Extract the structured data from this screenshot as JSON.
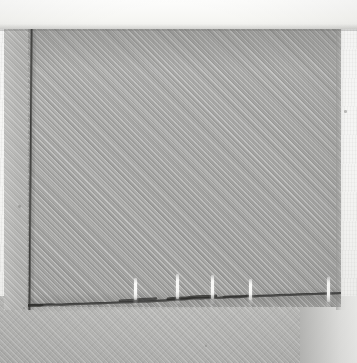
{
  "image": {
    "kind": "photograph",
    "subject": "grey woven twill fabric corner with seamed edge",
    "width": 357,
    "height": 363,
    "alt_text": "Close-up photograph of grey woven fabric showing a vertical stitched seam on the left and a dark raw cut bottom edge with five white thread markers"
  },
  "background": {
    "paper_color": "#f6f6f4",
    "top_band_color": "#fcfcfb",
    "top_band_height": 29
  },
  "regions": {
    "main_cloth": {
      "label": "main fabric panel",
      "color": "#a8a8a6",
      "x": 28,
      "y": 29,
      "width": 313,
      "height": 278,
      "weave": "twill-diagonal-45"
    },
    "selvage_strip": {
      "label": "left selvage strip",
      "color": "#b6b6b4",
      "x": 4,
      "y": 29,
      "width": 26,
      "height": 281
    },
    "under_cloth": {
      "label": "lower fabric plane",
      "color": "#b7b7b5",
      "x": 0,
      "y": 296,
      "width": 341,
      "height": 67
    }
  },
  "features": {
    "vertical_seam": {
      "label": "vertical stitched seam line",
      "color": "#343432",
      "x": 28,
      "y_top": 29,
      "y_bottom": 310,
      "thickness": 3
    },
    "raw_edge": {
      "label": "bottom raw cut edge",
      "color": "#3d3d3b",
      "y_left": 308,
      "y_right": 298,
      "tilt_degrees": -1.35
    },
    "corner": {
      "label": "seam corner junction",
      "x": 28,
      "y": 308
    }
  },
  "thread_markers": {
    "label": "white thread markers",
    "color": "#fafaf8",
    "count": 5,
    "items": [
      {
        "name": "thread-marker-1",
        "x": 134,
        "top": 278,
        "height": 22
      },
      {
        "name": "thread-marker-2",
        "x": 176,
        "top": 274,
        "height": 25
      },
      {
        "name": "thread-marker-3",
        "x": 211,
        "top": 275,
        "height": 24
      },
      {
        "name": "thread-marker-4",
        "x": 249,
        "top": 279,
        "height": 21
      },
      {
        "name": "thread-marker-5",
        "x": 327,
        "top": 277,
        "height": 25
      }
    ]
  },
  "specks": [
    {
      "x": 18,
      "y": 205,
      "r": 1.4
    },
    {
      "x": 344,
      "y": 110,
      "r": 1.3
    },
    {
      "x": 23,
      "y": 307,
      "r": 1.2
    },
    {
      "x": 205,
      "y": 345,
      "r": 1.1
    }
  ]
}
